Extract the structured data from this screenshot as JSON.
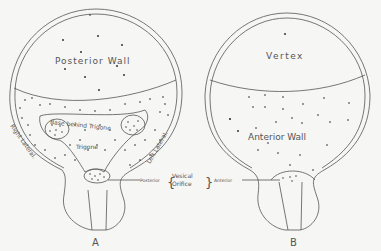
{
  "figure": {
    "panels": [
      {
        "id": "A",
        "label": "A",
        "regions": {
          "upper": "Posterior Wall",
          "base": "Base behind Trigone",
          "trigone": "Trigone",
          "right_side": "Right Lateral.",
          "left_side": "Left Lateral."
        }
      },
      {
        "id": "B",
        "label": "B",
        "regions": {
          "upper": "Vertex",
          "lower": "Anterior Wall"
        }
      }
    ],
    "orifice": {
      "left_pointer": "Posterior",
      "brace_top": "Vesical",
      "brace_bottom": "Orifice",
      "right_pointer": "Anterior"
    }
  },
  "colors": {
    "background": "#f6f6f4",
    "ink": "#444444",
    "dots": "#222222"
  }
}
